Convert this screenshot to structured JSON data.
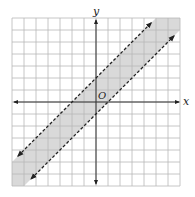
{
  "chart_data": {
    "type": "line",
    "title": "",
    "xlabel": "x",
    "ylabel": "y",
    "origin_label": "O",
    "xlim": [
      -7,
      7
    ],
    "ylim": [
      -7,
      7
    ],
    "grid": true,
    "grid_step": 1,
    "series": [
      {
        "name": "upper boundary",
        "equation": "y = x + 2",
        "slope": 1,
        "intercept": 2,
        "style": "dashed"
      },
      {
        "name": "lower boundary",
        "equation": "y = x - 1",
        "slope": 1,
        "intercept": -1,
        "style": "dashed"
      }
    ],
    "shaded_region": "x - 1 < y < x + 2",
    "colors": {
      "shade": "#d9d9d9",
      "grid": "#b8b8b8",
      "axis": "#333333",
      "line": "#222222"
    }
  }
}
